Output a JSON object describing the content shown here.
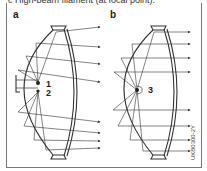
{
  "caption": "c High-beam filament (at focal point).",
  "panels": [
    {
      "label": "a",
      "callouts": [
        "1",
        "2"
      ]
    },
    {
      "label": "b",
      "callouts": [
        "3"
      ]
    }
  ],
  "figure_code": "UKB0300-2Y",
  "colors": {
    "line": "#333333",
    "frame": "#777777",
    "background": "#ffffff"
  }
}
